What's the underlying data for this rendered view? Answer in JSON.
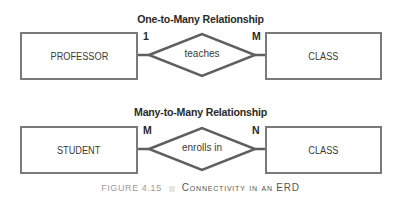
{
  "diagrams": [
    {
      "title": "One-to-Many Relationship",
      "left_entity": "PROFESSOR",
      "relationship": "teaches",
      "right_entity": "CLASS",
      "left_cardinality": "1",
      "right_cardinality": "M"
    },
    {
      "title": "Many-to-Many Relationship",
      "left_entity": "STUDENT",
      "relationship": "enrolls in",
      "right_entity": "CLASS",
      "left_cardinality": "M",
      "right_cardinality": "N"
    }
  ],
  "caption": {
    "figure_label": "FIGURE 4.15",
    "title": "Connectivity in an ERD"
  },
  "colors": {
    "line": "#5f5f5f",
    "box_border": "#7a7a7a",
    "text": "#2a2a2a",
    "caption_gray": "#9a9a9a"
  }
}
